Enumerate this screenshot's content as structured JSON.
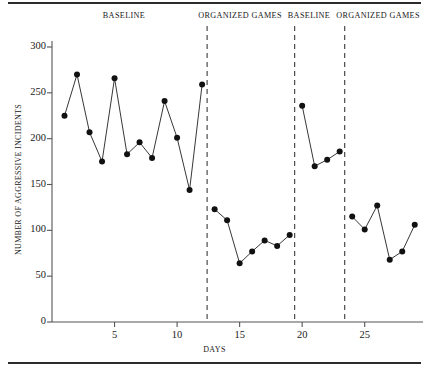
{
  "chart_data": {
    "type": "line",
    "title": "",
    "xlabel": "DAYS",
    "ylabel": "NUMBER OF AGGRESSIVE INCIDENTS",
    "xlim": [
      0,
      29.5
    ],
    "ylim": [
      0,
      310
    ],
    "grid": false,
    "legend": "none",
    "y_ticks": [
      0,
      50,
      100,
      150,
      200,
      250,
      300
    ],
    "x_ticks": [
      5,
      10,
      15,
      20,
      25
    ],
    "marker": "filled-circle",
    "line_color": "#202020",
    "marker_color": "#111111",
    "phase_line_style": "dashed",
    "phases": [
      {
        "label": "BASELINE",
        "x_start": 0.5,
        "x_end": 12.4
      },
      {
        "label": "ORGANIZED GAMES",
        "x_start": 12.4,
        "x_end": 19.4
      },
      {
        "label": "BASELINE",
        "x_start": 19.4,
        "x_end": 23.4
      },
      {
        "label": "ORGANIZED GAMES",
        "x_start": 23.4,
        "x_end": 29.5
      }
    ],
    "phase_dividers": [
      12.4,
      19.4,
      23.4
    ],
    "series": [
      {
        "name": "Aggressive incidents",
        "segments": [
          {
            "phase": "BASELINE",
            "x": [
              1,
              2,
              3,
              4,
              5,
              6,
              7,
              8,
              9,
              10,
              11,
              12
            ],
            "values": [
              225,
              270,
              207,
              175,
              266,
              183,
              196,
              179,
              241,
              201,
              144,
              259
            ]
          },
          {
            "phase": "ORGANIZED GAMES",
            "x": [
              13,
              14,
              15,
              16,
              17,
              18,
              19
            ],
            "values": [
              123,
              111,
              64,
              77,
              89,
              83,
              95
            ]
          },
          {
            "phase": "BASELINE",
            "x": [
              20,
              21,
              22,
              23
            ],
            "values": [
              236,
              170,
              177,
              186
            ]
          },
          {
            "phase": "ORGANIZED GAMES",
            "x": [
              24,
              25,
              26,
              27,
              28,
              29
            ],
            "values": [
              115,
              101,
              127,
              68,
              77,
              106
            ]
          }
        ]
      }
    ]
  }
}
